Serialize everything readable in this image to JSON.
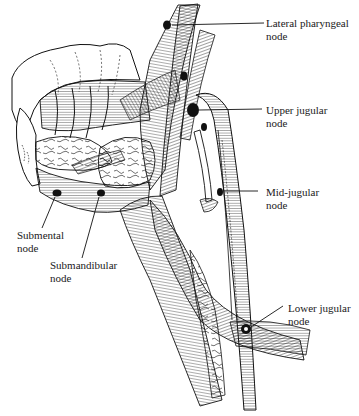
{
  "figure": {
    "colors": {
      "ink": "#111111",
      "paper": "#ffffff",
      "label": "#1a1a1a"
    }
  },
  "labels": [
    {
      "id": "lateral-pharyngeal",
      "line1": "Lateral pharyngeal",
      "line2": "node"
    },
    {
      "id": "upper-jugular",
      "line1": "Upper jugular",
      "line2": "node"
    },
    {
      "id": "mid-jugular",
      "line1": "Mid-jugular",
      "line2": "node"
    },
    {
      "id": "submental",
      "line1": "Submental",
      "line2": "node"
    },
    {
      "id": "submandibular",
      "line1": "Submandibular",
      "line2": "node"
    },
    {
      "id": "lower-jugular",
      "line1": "Lower jugular",
      "line2": "node"
    }
  ]
}
